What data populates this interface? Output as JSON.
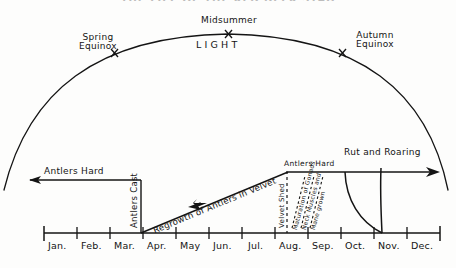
{
  "figure": {
    "title": "THE LIFE OF THE RED DEER STAG",
    "light_curve_label": "LIGHT"
  },
  "arc_markers": [
    {
      "name": "spring-equinox",
      "label_line1": "Spring",
      "label_line2": "Equinox",
      "marker": "×"
    },
    {
      "name": "midsummer",
      "label_line1": "Midsummer",
      "label_line2": "",
      "marker": "×"
    },
    {
      "name": "autumn-equinox",
      "label_line1": "Autumn",
      "label_line2": "Equinox",
      "marker": "×"
    }
  ],
  "events": {
    "antlers_hard_winter": "Antlers Hard",
    "antlers_cast": "Antlers Cast",
    "regrowth": "Regrowth of Antlers in Velvet",
    "velvet_shed": "Velvet Shed",
    "antlers_hard_autumn": "Antlers Hard",
    "rut": "Rut and Roaring",
    "gonads": "Maturation of Gonads",
    "neck": "Neck Muscles and",
    "mane": "Mane grown"
  },
  "axis": {
    "months": [
      "Jan.",
      "Feb.",
      "Mar.",
      "Apr.",
      "May",
      "Jun.",
      "Jul.",
      "Aug.",
      "Sep.",
      "Oct.",
      "Nov.",
      "Dec."
    ]
  },
  "colors": {
    "ink": "#141414",
    "paper": "#fdfdfc"
  }
}
